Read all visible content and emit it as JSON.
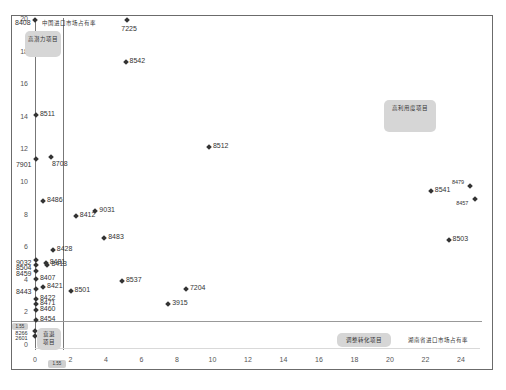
{
  "chart_data": {
    "type": "scatter",
    "title": "",
    "xlabel": "",
    "ylabel": "",
    "xlim": [
      0,
      25
    ],
    "ylim": [
      0,
      20
    ],
    "x_ticks": [
      "0",
      "2",
      "4",
      "6",
      "8",
      "10",
      "12",
      "14",
      "16",
      "18",
      "20",
      "22",
      "24"
    ],
    "y_ticks": [
      "0",
      "2",
      "4",
      "6",
      "8",
      "10",
      "12",
      "14",
      "16",
      "18",
      "20"
    ],
    "grid": false,
    "reference_lines": {
      "vertical_x": [
        0,
        1.55
      ],
      "horizontal_y": [
        1.55
      ],
      "vertical_tag": "1.55",
      "horizontal_tag": "1.55"
    },
    "quadrant_labels": [
      {
        "label": "高潜力项目",
        "position": "top-left"
      },
      {
        "label": "高利用度项目",
        "position": "top-right"
      },
      {
        "label": "衰退项目",
        "position": "bottom-left"
      },
      {
        "label": "调整转化项目",
        "position": "bottom-right"
      }
    ],
    "axis_annotations": {
      "y_axis_title": "中国进口市场占有率",
      "x_axis_title": "湖南省进口市场占有率"
    },
    "points": [
      {
        "label": "8408",
        "x": 0.0,
        "y": 20.0
      },
      {
        "label": "7225",
        "x": 5.2,
        "y": 20.0
      },
      {
        "label": "8542",
        "x": 5.1,
        "y": 17.4
      },
      {
        "label": "8511",
        "x": 0.05,
        "y": 14.2
      },
      {
        "label": "7901",
        "x": 0.05,
        "y": 11.5
      },
      {
        "label": "8708",
        "x": 0.9,
        "y": 11.6
      },
      {
        "label": "8512",
        "x": 9.8,
        "y": 12.2
      },
      {
        "label": "8486",
        "x": 0.45,
        "y": 8.9
      },
      {
        "label": "8412",
        "x": 2.3,
        "y": 8.0
      },
      {
        "label": "9031",
        "x": 3.4,
        "y": 8.3
      },
      {
        "label": "8483",
        "x": 3.9,
        "y": 6.6
      },
      {
        "label": "8428",
        "x": 1.0,
        "y": 5.9
      },
      {
        "label": "9032",
        "x": 0.05,
        "y": 5.3
      },
      {
        "label": "8481",
        "x": 0.6,
        "y": 5.1
      },
      {
        "label": "8504",
        "x": 0.05,
        "y": 4.95
      },
      {
        "label": "8413",
        "x": 0.7,
        "y": 4.95
      },
      {
        "label": "8459",
        "x": 0.05,
        "y": 4.6
      },
      {
        "label": "8407",
        "x": 0.05,
        "y": 4.1
      },
      {
        "label": "8443",
        "x": 0.05,
        "y": 3.5
      },
      {
        "label": "8421",
        "x": 0.45,
        "y": 3.65
      },
      {
        "label": "8501",
        "x": 2.0,
        "y": 3.4
      },
      {
        "label": "8537",
        "x": 4.9,
        "y": 4.0
      },
      {
        "label": "7204",
        "x": 8.5,
        "y": 3.5
      },
      {
        "label": "3915",
        "x": 7.5,
        "y": 2.6
      },
      {
        "label": "8422",
        "x": 0.05,
        "y": 2.9
      },
      {
        "label": "8471",
        "x": 0.05,
        "y": 2.6
      },
      {
        "label": "8460",
        "x": 0.05,
        "y": 2.2
      },
      {
        "label": "8454",
        "x": 0.05,
        "y": 1.6
      },
      {
        "label": "8266",
        "x": 0.02,
        "y": 0.9
      },
      {
        "label": "2601",
        "x": 0.02,
        "y": 0.6
      },
      {
        "label": "8541",
        "x": 22.3,
        "y": 9.5
      },
      {
        "label": "8479",
        "x": 24.5,
        "y": 9.8
      },
      {
        "label": "8457",
        "x": 24.8,
        "y": 9.0
      },
      {
        "label": "8503",
        "x": 23.3,
        "y": 6.5
      }
    ]
  },
  "labels": {
    "quad_top_left": "高潜力项目",
    "quad_top_right": "高利用度项目",
    "quad_bottom_left_line1": "衰退",
    "quad_bottom_left_line2": "项目",
    "quad_bottom_right": "调整转化项目",
    "y_axis_title": "中国进口市场占有率",
    "x_axis_title": "湖南省进口市场占有率",
    "ref_tag_x": "1.55",
    "ref_tag_y": "1.55"
  }
}
